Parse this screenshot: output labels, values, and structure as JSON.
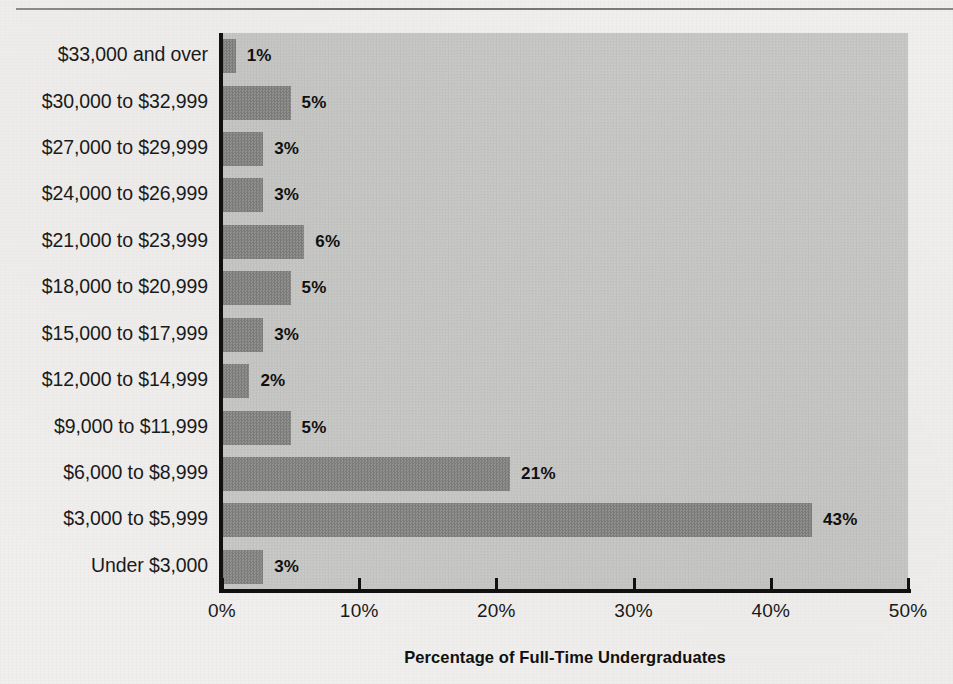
{
  "figure": {
    "background_color": "#f0efee",
    "plot_background_color": "#cacac8",
    "bar_color": "#8c8c8a",
    "axis_color": "#111111",
    "has_top_rule": true
  },
  "chart_data": {
    "type": "bar",
    "orientation": "horizontal",
    "title": "",
    "xlabel": "Percentage of Full-Time Undergraduates",
    "ylabel": "",
    "xlim": [
      0,
      50
    ],
    "xticks": [
      0,
      10,
      20,
      30,
      40,
      50
    ],
    "xtick_labels": [
      "0%",
      "10%",
      "20%",
      "30%",
      "40%",
      "50%"
    ],
    "grid": false,
    "legend": null,
    "value_label_suffix": "%",
    "categories": [
      "$33,000 and over",
      "$30,000 to $32,999",
      "$27,000 to $29,999",
      "$24,000 to $26,999",
      "$21,000 to $23,999",
      "$18,000 to $20,999",
      "$15,000 to $17,999",
      "$12,000 to $14,999",
      "$9,000 to $11,999",
      "$6,000 to $8,999",
      "$3,000 to $5,999",
      "Under $3,000"
    ],
    "values": [
      1,
      5,
      3,
      3,
      6,
      5,
      3,
      2,
      5,
      21,
      43,
      3
    ],
    "value_labels": [
      "1%",
      "5%",
      "3%",
      "3%",
      "6%",
      "5%",
      "3%",
      "2%",
      "5%",
      "21%",
      "43%",
      "3%"
    ]
  }
}
